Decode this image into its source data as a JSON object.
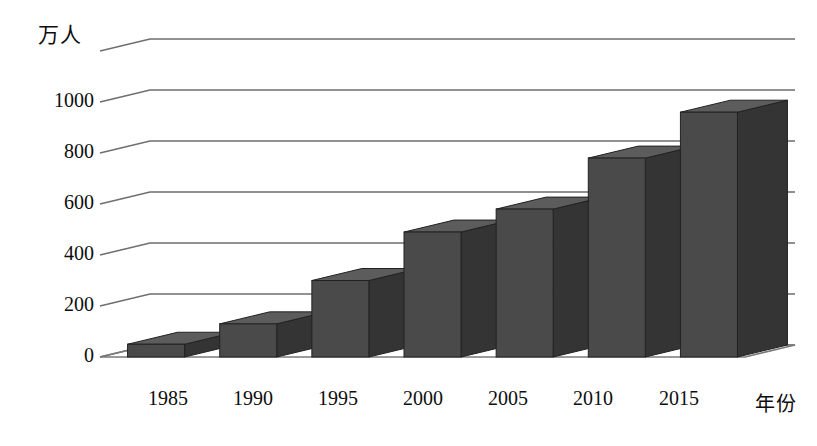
{
  "chart_data": {
    "type": "bar",
    "title": "",
    "subtitle": "",
    "ylabel": "万人",
    "xlabel": "年份",
    "categories": [
      "1985",
      "1990",
      "1995",
      "2000",
      "2005",
      "2010",
      "2015"
    ],
    "values": [
      50,
      130,
      300,
      490,
      580,
      780,
      960
    ],
    "ylim": [
      0,
      1200
    ],
    "ytick_labels": [
      "0",
      "200",
      "400",
      "600",
      "800",
      "1000"
    ],
    "ytick_values": [
      0,
      200,
      400,
      600,
      800,
      1000
    ],
    "grid": true,
    "legend": null,
    "legend_position": "none",
    "style": "3d-column",
    "annotations": [],
    "colors": {
      "bar_front": "#4a4a4a",
      "bar_side": "#343434",
      "bar_top": "#5c5c5c",
      "bar_outline": "#222222",
      "gridline": "#6e6e6e",
      "floor": "#7a7a7a",
      "text": "#0d0d0d",
      "background": "#ffffff"
    }
  },
  "axes": {
    "y_unit_label": "万人",
    "x_title": "年份",
    "y_ticks": [
      {
        "label": "1000"
      },
      {
        "label": "800"
      },
      {
        "label": "600"
      },
      {
        "label": "400"
      },
      {
        "label": "200"
      },
      {
        "label": "0"
      }
    ],
    "x_ticks": [
      {
        "label": "1985"
      },
      {
        "label": "1990"
      },
      {
        "label": "1995"
      },
      {
        "label": "2000"
      },
      {
        "label": "2005"
      },
      {
        "label": "2010"
      },
      {
        "label": "2015"
      }
    ]
  }
}
